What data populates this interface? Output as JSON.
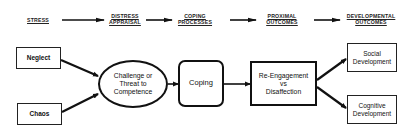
{
  "diagram": {
    "stages": [
      {
        "line1": "STRESS",
        "line2": ""
      },
      {
        "line1": "DISTRESS",
        "line2": "APPRAISAL"
      },
      {
        "line1": "COPING",
        "line2": "PROCESSES"
      },
      {
        "line1": "PROXIMAL",
        "line2": "OUTCOMES"
      },
      {
        "line1": "DEVELOPMENTAL",
        "line2": "OUTCOMES"
      }
    ],
    "nodes": {
      "neglect": {
        "label": "Neglect"
      },
      "chaos": {
        "label": "Chaos"
      },
      "appraisal": {
        "line1": "Challenge or",
        "line2": "Threat to",
        "line3": "Competence"
      },
      "coping": {
        "label": "Coping"
      },
      "proximal": {
        "line1": "Re-Engagement",
        "line2": "vs",
        "line3": "Disaffection"
      },
      "social": {
        "line1": "Social",
        "line2": "Development"
      },
      "cognitive": {
        "line1": "Cognitive",
        "line2": "Development"
      }
    },
    "edges": [
      {
        "from": "stress-header",
        "to": "appraisal-header"
      },
      {
        "from": "appraisal-header",
        "to": "coping-header"
      },
      {
        "from": "coping-header",
        "to": "proximal-header"
      },
      {
        "from": "proximal-header",
        "to": "developmental-header"
      },
      {
        "from": "neglect",
        "to": "appraisal"
      },
      {
        "from": "chaos",
        "to": "appraisal"
      },
      {
        "from": "appraisal",
        "to": "coping"
      },
      {
        "from": "coping",
        "to": "proximal"
      },
      {
        "from": "proximal",
        "to": "social"
      },
      {
        "from": "proximal",
        "to": "cognitive"
      }
    ],
    "colors": {
      "line": "#111111",
      "background": "#ffffff"
    }
  }
}
